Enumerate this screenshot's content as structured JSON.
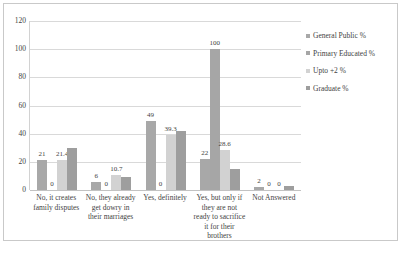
{
  "chart_data": {
    "type": "bar",
    "title": "",
    "xlabel": "",
    "ylabel": "",
    "ylim": [
      0,
      120
    ],
    "yticks": [
      0,
      20,
      40,
      60,
      80,
      100,
      120
    ],
    "grid": true,
    "legend_position": "right",
    "categories": [
      "No, it creates family disputes",
      "No, they already get dowry in their marriages",
      "Yes, definitely",
      "Yes, but only if they are not ready to sacrifice it for their brothers",
      "Not Answered"
    ],
    "series": [
      {
        "name": "General Public %",
        "color": "#a8a8a8",
        "values": [
          21,
          6,
          49,
          22,
          2
        ]
      },
      {
        "name": "Primary Educated %",
        "color": "#a6a6a6",
        "values": [
          0,
          0,
          0,
          100,
          0
        ]
      },
      {
        "name": "Upto +2 %",
        "color": "#d2d2d2",
        "values": [
          21.4,
          10.7,
          39.3,
          28.6,
          0
        ]
      },
      {
        "name": "Graduate %",
        "color": "#9e9e9e",
        "values": [
          30,
          9,
          42,
          15,
          3
        ]
      }
    ],
    "data_labels": [
      [
        "21",
        "0",
        "21.4",
        ""
      ],
      [
        "6",
        "0",
        "10.7",
        ""
      ],
      [
        "49",
        "0",
        "39.3",
        ""
      ],
      [
        "22",
        "100",
        "28.6",
        ""
      ],
      [
        "2",
        "0",
        "0",
        ""
      ]
    ]
  },
  "caption": {
    "text": ""
  }
}
